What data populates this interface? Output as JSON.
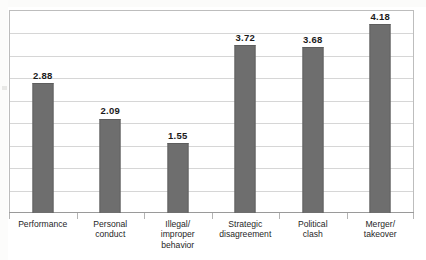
{
  "chart_data": {
    "type": "bar",
    "title": "",
    "subtitle": "",
    "xlabel": "",
    "ylabel": "",
    "categories": [
      "Performance",
      "Personal\nconduct",
      "Illegal/\nimproper\nbehavior",
      "Strategic\ndisagreement",
      "Political\nclash",
      "Merger/\ntakeover"
    ],
    "values": [
      2.88,
      2.09,
      1.55,
      3.72,
      3.68,
      4.18
    ],
    "value_labels": [
      "2.88",
      "2.09",
      "1.55",
      "3.72",
      "3.68",
      "4.18"
    ],
    "ylim": [
      0,
      4.5
    ],
    "grid": true,
    "gridlines": 9,
    "y_tick_labels": [],
    "legend": "none",
    "bar_color": "#6e6e6e",
    "label_color": "#1a1a1a",
    "grid_color": "#d6d6d6",
    "frame_color": "#bdbdbd",
    "background": "#ffffff"
  }
}
